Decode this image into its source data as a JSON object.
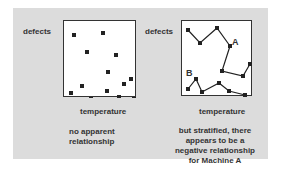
{
  "left_panel": {
    "y_label": "defects",
    "x_label": "temperature",
    "caption_lines": [
      "no apparent",
      "relationship"
    ],
    "points": [
      [
        10,
        14
      ],
      [
        39,
        12
      ],
      [
        23,
        31
      ],
      [
        52,
        34
      ],
      [
        67,
        58
      ],
      [
        44,
        51
      ],
      [
        60,
        63
      ],
      [
        18,
        65
      ],
      [
        7,
        72
      ],
      [
        43,
        70
      ],
      [
        27,
        78
      ],
      [
        55,
        76
      ],
      [
        70,
        78
      ]
    ]
  },
  "right_panel": {
    "y_label": "defects",
    "x_label": "temperature",
    "caption_lines": [
      "but stratified, there",
      "appears to be a",
      "negative relationship",
      "for Machine A"
    ],
    "series": [
      {
        "name": "A",
        "points": [
          [
            6,
            9
          ],
          [
            18,
            22
          ],
          [
            35,
            7
          ],
          [
            48,
            25
          ],
          [
            40,
            50
          ],
          [
            61,
            55
          ],
          [
            68,
            43
          ]
        ]
      },
      {
        "name": "B",
        "points": [
          [
            6,
            68
          ],
          [
            14,
            58
          ],
          [
            20,
            71
          ],
          [
            37,
            62
          ],
          [
            47,
            70
          ],
          [
            63,
            74
          ]
        ]
      }
    ]
  },
  "colors": {
    "panel_bg": "#dcdcdc",
    "plot_bg": "#ffffff",
    "ink": "#222222"
  }
}
